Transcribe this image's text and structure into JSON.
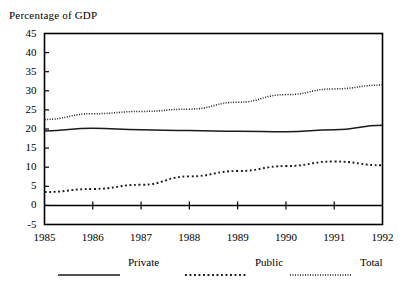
{
  "chart_data": {
    "type": "line",
    "title": "Percentage of GDP",
    "xlabel": "",
    "ylabel": "",
    "x": [
      1985,
      1986,
      1987,
      1988,
      1989,
      1990,
      1991,
      1992
    ],
    "categories": [
      "1985",
      "1986",
      "1987",
      "1988",
      "1989",
      "1990",
      "1991",
      "1992"
    ],
    "series": [
      {
        "name": "Private",
        "style": "solid",
        "values": [
          19.5,
          20.2,
          19.8,
          19.6,
          19.4,
          19.3,
          19.8,
          21.0
        ]
      },
      {
        "name": "Public",
        "style": "dotted-coarse",
        "values": [
          3.5,
          4.3,
          5.4,
          7.6,
          9.0,
          10.3,
          11.5,
          10.5
        ]
      },
      {
        "name": "Total",
        "style": "dotted-fine",
        "values": [
          22.5,
          24.0,
          24.6,
          25.2,
          27.0,
          29.0,
          30.5,
          31.5
        ]
      }
    ],
    "ylim": [
      -5,
      45
    ],
    "yticks": [
      -5,
      0,
      5,
      10,
      15,
      20,
      25,
      30,
      35,
      40,
      45
    ],
    "ytick_labels": [
      "-5",
      "0",
      "5",
      "10",
      "15",
      "20",
      "25",
      "30",
      "35",
      "40",
      "45"
    ],
    "xlim": [
      1985,
      1992
    ],
    "xticks": [
      1985,
      1986,
      1987,
      1988,
      1989,
      1990,
      1991,
      1992
    ],
    "grid": false,
    "zero_line": true,
    "legend_position": "bottom",
    "line_color": "#1a1a1a",
    "frame_color": "#000000",
    "background": "#ffffff"
  },
  "legend": {
    "entries": [
      {
        "label": "Private",
        "style": "solid"
      },
      {
        "label": "Public",
        "style": "dotted-coarse"
      },
      {
        "label": "Total",
        "style": "dotted-fine"
      }
    ]
  }
}
